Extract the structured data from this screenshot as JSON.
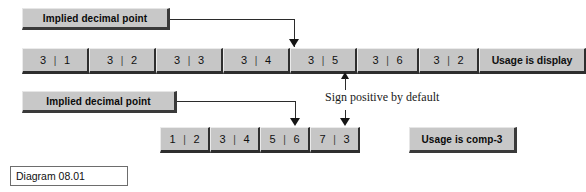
{
  "diagram": {
    "caption": "Diagram 08.01",
    "callouts": {
      "implied_decimal_point_top": "Implied decimal point",
      "implied_decimal_point_bottom": "Implied decimal point"
    },
    "annotations": {
      "sign_positive": "Sign positive by default"
    },
    "row_display": {
      "usage_label": "Usage is display",
      "cells": [
        {
          "left": "3",
          "sep": "|",
          "right": "1"
        },
        {
          "left": "3",
          "sep": "|",
          "right": "2"
        },
        {
          "left": "3",
          "sep": "|",
          "right": "3"
        },
        {
          "left": "3",
          "sep": "|",
          "right": "4"
        },
        {
          "left": "3",
          "sep": "|",
          "right": "5"
        },
        {
          "left": "3",
          "sep": "|",
          "right": "6"
        },
        {
          "left": "3",
          "sep": "|",
          "right": "2"
        }
      ]
    },
    "row_comp3": {
      "usage_label": "Usage is comp-3",
      "cells": [
        {
          "left": "1",
          "sep": "|",
          "right": "2"
        },
        {
          "left": "3",
          "sep": "|",
          "right": "4"
        },
        {
          "left": "5",
          "sep": "|",
          "right": "6"
        },
        {
          "left": "7",
          "sep": "|",
          "right": "3"
        }
      ]
    },
    "colors": {
      "cell_fill": "#c6c6c6",
      "callout_fill": "#c8c8c8",
      "line": "#2b2b2b",
      "page": "#ffffff"
    }
  }
}
